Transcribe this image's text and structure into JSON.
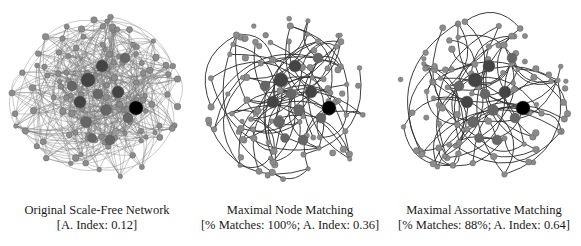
{
  "panels": [
    {
      "id": "original",
      "title": "Original Scale-Free Network",
      "subtitle": "[A. Index: 0.12]",
      "density": "dense"
    },
    {
      "id": "node-matching",
      "title": "Maximal Node Matching",
      "subtitle": "[% Matches: 100%; A. Index: 0.36]",
      "density": "sparse"
    },
    {
      "id": "assortative-matching",
      "title": "Maximal Assortative Matching",
      "subtitle": "[% Matches: 88%; A. Index: 0.64]",
      "density": "sparse"
    }
  ],
  "colors": {
    "hub_node": "#000000",
    "large_node": "#444444",
    "medium_node": "#666666",
    "small_node": "#8c8c8c",
    "edge": "#333333",
    "edge_dense": "#7a7a7a"
  }
}
